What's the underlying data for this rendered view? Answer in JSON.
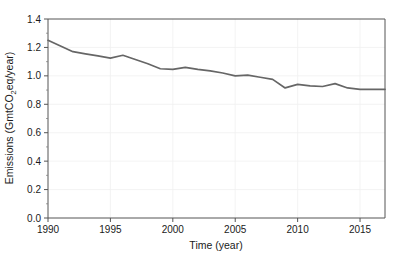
{
  "chart_data": {
    "type": "line",
    "title": "",
    "xlabel": "Time (year)",
    "ylabel_plain": "Emissions (GmtCO2eq/year)",
    "ylabel_parts": {
      "before": "Emissions (GmtCO",
      "subscript": "2",
      "after": "eq/year)"
    },
    "xlim": [
      1990,
      2017
    ],
    "ylim": [
      0.0,
      1.4
    ],
    "xticks": [
      1990,
      1995,
      2000,
      2005,
      2010,
      2015
    ],
    "xtick_labels": [
      "1990",
      "1995",
      "2000",
      "2005",
      "2010",
      "2015"
    ],
    "yticks": [
      0.0,
      0.2,
      0.4,
      0.6,
      0.8,
      1.0,
      1.2,
      1.4
    ],
    "ytick_labels": [
      "0.0",
      "0.2",
      "0.4",
      "0.6",
      "0.8",
      "1.0",
      "1.2",
      "1.4"
    ],
    "grid": true,
    "legend": false,
    "legend_position": "none",
    "line_color": "#666666",
    "series": [
      {
        "name": "Emissions",
        "x": [
          1990,
          1991,
          1992,
          1993,
          1994,
          1995,
          1996,
          1997,
          1998,
          1999,
          2000,
          2001,
          2002,
          2003,
          2004,
          2005,
          2006,
          2007,
          2008,
          2009,
          2010,
          2011,
          2012,
          2013,
          2014,
          2015,
          2016,
          2017
        ],
        "values": [
          1.25,
          1.21,
          1.17,
          1.155,
          1.14,
          1.125,
          1.145,
          1.115,
          1.085,
          1.05,
          1.045,
          1.06,
          1.045,
          1.035,
          1.02,
          1.0,
          1.005,
          0.99,
          0.975,
          0.915,
          0.94,
          0.93,
          0.925,
          0.945,
          0.915,
          0.905,
          0.905,
          0.905
        ]
      }
    ]
  }
}
